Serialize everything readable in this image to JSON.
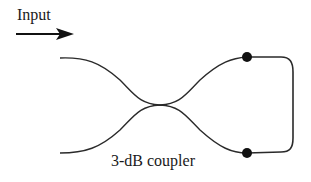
{
  "diagram": {
    "input_label": "Input",
    "coupler_label": "3-dB coupler",
    "colors": {
      "line": "#2a2a2a",
      "dot": "#111111",
      "text": "#1a1a1a",
      "background": "#ffffff"
    }
  }
}
